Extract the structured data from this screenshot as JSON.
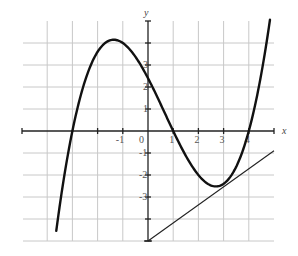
{
  "chart_data": {
    "type": "line",
    "title": "",
    "xlabel": "x",
    "ylabel": "y",
    "xlim": [
      -5,
      5
    ],
    "ylim": [
      -5,
      5
    ],
    "grid": true,
    "legend": null,
    "x_tick_labels": [
      {
        "value": -1,
        "label": "-1"
      },
      {
        "value": 0,
        "label": "0"
      },
      {
        "value": 1,
        "label": "1"
      },
      {
        "value": 2,
        "label": "2"
      },
      {
        "value": 3,
        "label": "3"
      },
      {
        "value": 4,
        "label": "4"
      }
    ],
    "y_tick_labels": [
      {
        "value": 3,
        "label": "3"
      },
      {
        "value": 2,
        "label": "2"
      },
      {
        "value": 1,
        "label": "1"
      },
      {
        "value": -1,
        "label": "-1"
      },
      {
        "value": -2,
        "label": "-2"
      },
      {
        "value": -3,
        "label": "-3"
      }
    ],
    "series": [
      {
        "name": "cubic curve",
        "style": "thick",
        "description": "f(x) ≈ 0.2(x+3)(x-1)(x-4)",
        "roots": [
          -3,
          1,
          4
        ],
        "local_max": {
          "x": -1.5,
          "y": 4.1
        },
        "local_min": {
          "x": 2.9,
          "y": -2.5
        },
        "y_intercept": 2.4,
        "x": [
          -3.64,
          -3.0,
          -2.5,
          -2.0,
          -1.5,
          -1.0,
          -0.5,
          0.0,
          0.5,
          1.0,
          1.5,
          2.0,
          2.5,
          3.0,
          3.5,
          4.0,
          4.5,
          4.84
        ],
        "y": [
          -4.54,
          0.0,
          2.48,
          3.6,
          4.13,
          4.0,
          3.38,
          2.4,
          1.23,
          0.0,
          -1.13,
          -1.99,
          -2.48,
          -2.4,
          -1.63,
          0.0,
          2.64,
          5.06
        ]
      },
      {
        "name": "tangent line at x=3",
        "style": "thin",
        "x": [
          0,
          5
        ],
        "y": [
          -5,
          -0.9
        ]
      }
    ]
  }
}
